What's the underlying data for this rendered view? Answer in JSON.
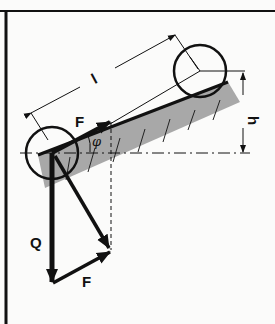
{
  "diagram": {
    "labels": {
      "length": "l",
      "height": "h",
      "force_top": "F",
      "angle": "φ",
      "weight": "Q",
      "force_bottom": "F"
    },
    "colors": {
      "ink": "#111111",
      "hatch_fill": "#a8a8a8",
      "background": "#fbfbfa"
    }
  }
}
